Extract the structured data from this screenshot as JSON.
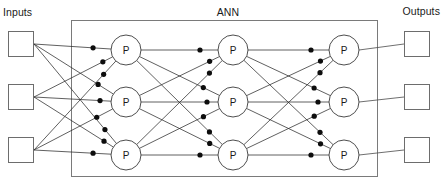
{
  "diagram": {
    "title": "ANN",
    "type": "artificial-neural-network",
    "inputs_label": "Inputs",
    "outputs_label": "Outputs",
    "node_label": "P",
    "node_label_meaning": "perceptron",
    "input_count": 3,
    "output_count": 3,
    "hidden_layer_count": 3,
    "nodes_per_layer": 3,
    "colors": {
      "background": "#ffffff",
      "edge": "#2b2b2b",
      "box_stroke": "#6d6d6d",
      "node_stroke": "#3a3a3a",
      "weight_dot": "#0d0d0d",
      "text": "#1a1a1a"
    },
    "geometry": {
      "canvas": [
        443,
        192
      ],
      "ann_border": {
        "x": 71,
        "y": 20,
        "width": 307,
        "height": 157
      },
      "input_boxes": [
        {
          "x": 8,
          "y": 31,
          "w": 26,
          "h": 26
        },
        {
          "x": 8,
          "y": 84,
          "w": 26,
          "h": 26
        },
        {
          "x": 8,
          "y": 137,
          "w": 26,
          "h": 26
        }
      ],
      "output_boxes": [
        {
          "x": 404,
          "y": 31,
          "w": 26,
          "h": 26
        },
        {
          "x": 404,
          "y": 84,
          "w": 26,
          "h": 26
        },
        {
          "x": 404,
          "y": 137,
          "w": 26,
          "h": 26
        }
      ],
      "layer_x": [
        126,
        233,
        344
      ],
      "row_y": [
        50,
        102,
        155
      ],
      "node_radius": 15,
      "dot_radius": 2.6
    },
    "connections": {
      "description": "fully-connected between adjacent layers",
      "input_to_layer1": 9,
      "layer1_to_layer2": 9,
      "layer2_to_layer3": 9,
      "layer3_to_output": 3,
      "weight_dots_per_node": 3,
      "weight_dots_total": 27
    }
  }
}
